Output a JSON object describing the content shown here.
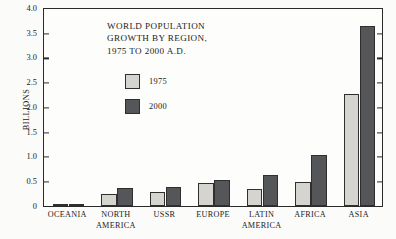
{
  "chart_data": {
    "type": "bar",
    "title_lines": [
      "WORLD POPULATION",
      "GROWTH BY REGION,",
      "1975 TO 2000 A.D."
    ],
    "xlabel": "",
    "ylabel": "BILLIONS",
    "ylim": [
      0,
      4.0
    ],
    "ytick_labels": [
      "4.0",
      "3.5",
      "3.0",
      "2.5",
      "2.0",
      "1.5",
      "1.0",
      "0.5",
      "0"
    ],
    "ytick_values": [
      4.0,
      3.5,
      3.0,
      2.5,
      2.0,
      1.5,
      1.0,
      0.5,
      0
    ],
    "grid": false,
    "legend_position": "upper-left-inside",
    "categories": [
      "OCEANIA",
      "NORTH AMERICA",
      "USSR",
      "EUROPE",
      "LATIN AMERICA",
      "AFRICA",
      "ASIA"
    ],
    "category_lines": [
      [
        "OCEANIA"
      ],
      [
        "NORTH",
        "AMERICA"
      ],
      [
        "USSR"
      ],
      [
        "EUROPE"
      ],
      [
        "LATIN",
        "AMERICA"
      ],
      [
        "AFRICA"
      ],
      [
        "ASIA"
      ]
    ],
    "series": [
      {
        "name": "1975",
        "color": "#d6d4cf",
        "values": [
          0.02,
          0.25,
          0.29,
          0.47,
          0.35,
          0.48,
          2.27
        ]
      },
      {
        "name": "2000",
        "color": "#55565a",
        "values": [
          0.05,
          0.36,
          0.39,
          0.52,
          0.62,
          1.03,
          3.65
        ]
      }
    ]
  },
  "legend": {
    "items": [
      {
        "label": "1975",
        "color": "#d6d4cf"
      },
      {
        "label": "2000",
        "color": "#55565a"
      }
    ]
  },
  "colors": {
    "series_1975": "#d6d4cf",
    "series_2000": "#55565a",
    "axis": "#2a2a2a",
    "text": "#1b1b1b",
    "background": "#fbfbfa"
  }
}
